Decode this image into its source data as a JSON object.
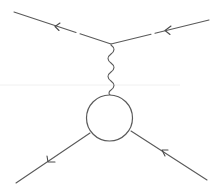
{
  "diagram": {
    "type": "feynman-diagram",
    "background": "#ffffff",
    "line_color": "#5a5a5a",
    "vertex": {
      "x": 111,
      "y": 44
    },
    "blob": {
      "cx": 109.5,
      "cy": 118,
      "r": 23
    },
    "lines": [
      {
        "name": "incoming-fermion-top-left",
        "kind": "fermion",
        "from": [
          14,
          12
        ],
        "to": [
          111,
          44
        ],
        "arrow_at": [
          57,
          27
        ],
        "arrow_dir": "left"
      },
      {
        "name": "incoming-fermion-top-right",
        "kind": "fermion",
        "from": [
          209,
          20
        ],
        "to": [
          111,
          44
        ],
        "arrow_at": [
          167,
          30
        ],
        "arrow_dir": "left"
      },
      {
        "name": "photon-propagator",
        "kind": "photon",
        "from": [
          111,
          45
        ],
        "to": [
          110,
          95
        ]
      },
      {
        "name": "outgoing-fermion-bottom-left",
        "kind": "fermion",
        "from": [
          90,
          133
        ],
        "to": [
          16,
          183
        ],
        "arrow_at": [
          50,
          160
        ],
        "arrow_dir": "down-left"
      },
      {
        "name": "incoming-fermion-bottom-right",
        "kind": "fermion",
        "from": [
          207,
          180
        ],
        "to": [
          131,
          131
        ],
        "arrow_at": [
          165,
          153
        ],
        "arrow_dir": "up-left"
      }
    ]
  }
}
